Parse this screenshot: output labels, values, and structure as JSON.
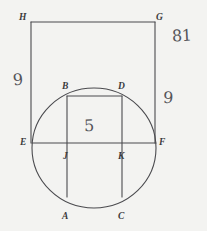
{
  "figure": {
    "background_color": "#f3f3f1",
    "ink_color": "#4a4a4e",
    "label_color": "#3a3a3c",
    "handwriting_color": "#55555a",
    "points": [
      {
        "id": "H",
        "label": "H",
        "x": 31,
        "y": 22,
        "label_x": 19,
        "label_y": 13
      },
      {
        "id": "G",
        "label": "G",
        "x": 155,
        "y": 22,
        "label_x": 156,
        "label_y": 13
      },
      {
        "id": "E",
        "label": "E",
        "x": 32,
        "y": 143,
        "label_x": 20,
        "label_y": 138
      },
      {
        "id": "F",
        "label": "F",
        "x": 156,
        "y": 143,
        "label_x": 159,
        "label_y": 138
      },
      {
        "id": "B",
        "label": "B",
        "x": 67,
        "y": 96,
        "label_x": 62,
        "label_y": 82
      },
      {
        "id": "D",
        "label": "D",
        "x": 122,
        "y": 96,
        "label_x": 118,
        "label_y": 82
      },
      {
        "id": "J",
        "label": "J",
        "x": 67,
        "y": 143,
        "label_x": 63,
        "label_y": 152
      },
      {
        "id": "K",
        "label": "K",
        "x": 122,
        "y": 143,
        "label_x": 118,
        "label_y": 152
      },
      {
        "id": "A",
        "label": "A",
        "x": 67,
        "y": 197,
        "label_x": 62,
        "label_y": 212
      },
      {
        "id": "C",
        "label": "C",
        "x": 122,
        "y": 197,
        "label_x": 118,
        "label_y": 212
      }
    ],
    "circle": {
      "cx": 94,
      "cy": 148,
      "rx": 62,
      "ry": 60
    },
    "rectangle": {
      "x": 31,
      "y": 22,
      "width": 124,
      "height": 121
    },
    "segments": [
      {
        "name": "segment-HG",
        "x1": 31,
        "y1": 22,
        "x2": 155,
        "y2": 22
      },
      {
        "name": "segment-HE",
        "x1": 31,
        "y1": 22,
        "x2": 31,
        "y2": 143
      },
      {
        "name": "segment-GF",
        "x1": 155,
        "y1": 22,
        "x2": 155,
        "y2": 143
      },
      {
        "name": "segment-EF",
        "x1": 32,
        "y1": 143,
        "x2": 156,
        "y2": 143
      },
      {
        "name": "segment-BA",
        "x1": 67,
        "y1": 96,
        "x2": 67,
        "y2": 197
      },
      {
        "name": "segment-DC",
        "x1": 122,
        "y1": 96,
        "x2": 122,
        "y2": 197
      },
      {
        "name": "segment-BD",
        "x1": 67,
        "y1": 96,
        "x2": 122,
        "y2": 96
      }
    ],
    "measurements": [
      {
        "id": "top-right",
        "value": "81",
        "x": 172,
        "y": 36
      },
      {
        "id": "left-side",
        "value": "9",
        "x": 13,
        "y": 80
      },
      {
        "id": "right-side",
        "value": "9",
        "x": 163,
        "y": 98
      },
      {
        "id": "center",
        "value": "5",
        "x": 84,
        "y": 124
      }
    ]
  }
}
